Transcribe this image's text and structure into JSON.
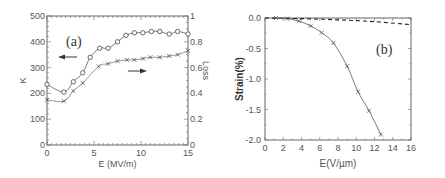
{
  "chart_data": [
    {
      "type": "line",
      "panel_label": "(a)",
      "xlabel": "E (MV/m)",
      "ylabel": "K",
      "y2label": "Loss",
      "xlim": [
        0,
        15
      ],
      "ylim": [
        0,
        500
      ],
      "y2lim": [
        0,
        1
      ],
      "xticks": [
        "0",
        "5",
        "10",
        "15"
      ],
      "yticks": [
        "0",
        "100",
        "200",
        "300",
        "400",
        "500"
      ],
      "y2ticks": [
        "0",
        "0.2",
        "0.4",
        "0.6",
        "0.8",
        "1"
      ],
      "grid": false,
      "annotations": [
        "left arrow pointing to K axis",
        "right arrow pointing to Loss axis"
      ],
      "series": [
        {
          "name": "K",
          "axis": "left",
          "marker": "circle",
          "x": [
            0,
            1.8,
            2.8,
            3.8,
            4.6,
            5.6,
            6.5,
            7.5,
            8.4,
            9.3,
            10.2,
            11.1,
            12,
            13,
            13.9,
            15
          ],
          "values": [
            235,
            205,
            245,
            280,
            340,
            375,
            375,
            400,
            425,
            435,
            435,
            440,
            440,
            430,
            440,
            430
          ]
        },
        {
          "name": "Loss",
          "axis": "right",
          "marker": "x",
          "x": [
            0,
            1.8,
            2.8,
            3.8,
            5.5,
            6.5,
            7.5,
            8.5,
            9.3,
            10.2,
            11,
            12,
            13,
            13.9,
            15
          ],
          "values": [
            0.35,
            0.34,
            0.42,
            0.48,
            0.61,
            0.63,
            0.65,
            0.66,
            0.66,
            0.67,
            0.68,
            0.68,
            0.69,
            0.7,
            0.73
          ]
        }
      ]
    },
    {
      "type": "line",
      "panel_label": "(b)",
      "xlabel": "E(V/µm)",
      "ylabel": "Strain(%)",
      "xlim": [
        0,
        16
      ],
      "ylim": [
        -2.0,
        0.0
      ],
      "xticks": [
        "0",
        "2",
        "4",
        "6",
        "8",
        "10",
        "12",
        "14",
        "16"
      ],
      "yticks": [
        "0.0",
        "-0.5",
        "-1.0",
        "-1.5",
        "-2.0"
      ],
      "grid": false,
      "series": [
        {
          "name": "measured",
          "style": "solid",
          "marker": "x",
          "x": [
            1.2,
            2.4,
            3.7,
            5.0,
            6.2,
            7.5,
            9.0,
            10.2,
            11.4,
            12.7
          ],
          "values": [
            0.0,
            -0.01,
            -0.05,
            -0.13,
            -0.24,
            -0.41,
            -0.79,
            -1.21,
            -1.52,
            -1.91
          ]
        },
        {
          "name": "reference",
          "style": "dashed",
          "marker": "none",
          "x": [
            0,
            4,
            8,
            12,
            16
          ],
          "values": [
            0.0,
            -0.01,
            -0.03,
            -0.06,
            -0.11
          ]
        }
      ]
    }
  ]
}
